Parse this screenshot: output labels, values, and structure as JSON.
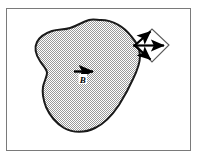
{
  "figure": {
    "title": "Vector field flux through a surface element",
    "frame": {
      "stroke_color": "#7a7a7a",
      "stroke_width": 1,
      "x": 6,
      "y": 8,
      "width": 185,
      "height": 143
    },
    "background_color": "#ffffff",
    "region": {
      "name": "shaded-region",
      "fill_color": "#c9c9c9",
      "fill_pattern": "checkerboard-dither",
      "stroke_color": "#1a1a1a",
      "stroke_width": 2
    },
    "field_arrow": {
      "name": "field-vector-arrow",
      "label": "B",
      "color": "#000000",
      "x_start": 74,
      "y_start": 72,
      "x_end": 96,
      "y_end": 72
    },
    "element": {
      "name": "surface-element-diamond",
      "stroke_color": "#555555",
      "fill_color": "#ffffff",
      "stroke_width": 1,
      "center_x": 152,
      "center_y": 45
    },
    "element_arrows": [
      {
        "name": "normal-arrow-up",
        "direction": "up-right",
        "color": "#000000"
      },
      {
        "name": "normal-arrow-right",
        "direction": "right",
        "color": "#000000"
      },
      {
        "name": "normal-arrow-down",
        "direction": "down-right",
        "color": "#000000"
      }
    ]
  }
}
